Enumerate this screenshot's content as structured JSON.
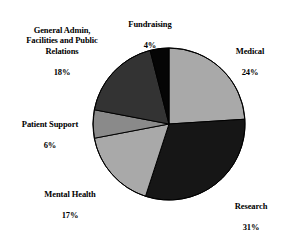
{
  "chart_data": {
    "type": "pie",
    "title": "",
    "categories": [
      "Medical",
      "Research",
      "Mental Health",
      "Patient Support",
      "General Admin, Facilities and Public Relations",
      "Fundraising"
    ],
    "values": [
      24,
      31,
      17,
      6,
      18,
      4
    ],
    "value_suffix": "%",
    "start_angle_deg": 0,
    "direction": "clockwise",
    "legend": "none",
    "grid": false,
    "slices": [
      {
        "name": "Medical",
        "label_line1": "Medical",
        "label_line2": "24%",
        "value": 24,
        "color": "#a9a9a9"
      },
      {
        "name": "Research",
        "label_line1": "Research",
        "label_line2": "31%",
        "value": 31,
        "color": "#161616"
      },
      {
        "name": "Mental Health",
        "label_line1": "Mental Health",
        "label_line2": "17%",
        "value": 17,
        "color": "#a9a9a9"
      },
      {
        "name": "Patient Support",
        "label_line1": "Patient Support",
        "label_line2": "6%",
        "value": 6,
        "color": "#8a8a8a"
      },
      {
        "name": "General Admin, Facilities and Public Relations",
        "label_line1": "General Admin,\nFacilities and Public\nRelations",
        "label_line2": "18%",
        "value": 18,
        "color": "#333333"
      },
      {
        "name": "Fundraising",
        "label_line1": "Fundraising",
        "label_line2": "4%",
        "value": 4,
        "color": "#050505"
      }
    ],
    "geometry": {
      "center_x": 169,
      "center_y": 124,
      "radius": 76
    },
    "stroke_color": "#000000"
  }
}
